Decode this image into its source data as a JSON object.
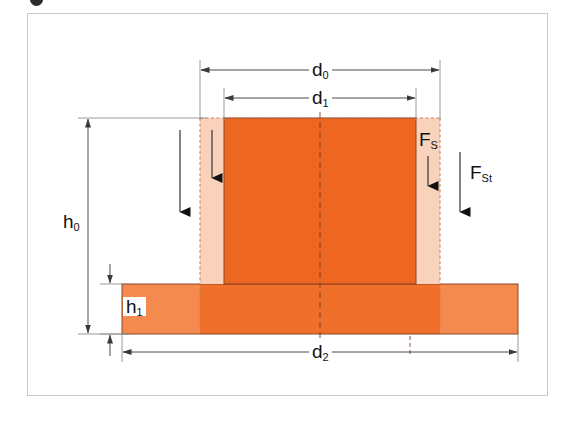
{
  "figure": {
    "type": "engineering-cross-section",
    "colors": {
      "core_orange": "#ee6722",
      "slab_inner_orange": "#ef6f2b",
      "slab_outer_orange": "#f58a4e",
      "sleeve_peach": "#f9d2bc",
      "outline": "#6f3a22",
      "frame_border": "#c9c9c9",
      "dimension_line": "#4a4a4a",
      "background": "#ffffff"
    },
    "dimensions": [
      {
        "id": "d0",
        "label": "d",
        "subscript": "0",
        "orientation": "horizontal",
        "position": "top"
      },
      {
        "id": "d1",
        "label": "d",
        "subscript": "1",
        "orientation": "horizontal",
        "position": "top"
      },
      {
        "id": "d2",
        "label": "d",
        "subscript": "2",
        "orientation": "horizontal",
        "position": "bottom"
      },
      {
        "id": "h0",
        "label": "h",
        "subscript": "0",
        "orientation": "vertical",
        "position": "left"
      },
      {
        "id": "h1",
        "label": "h",
        "subscript": "1",
        "orientation": "vertical",
        "position": "left"
      }
    ],
    "forces": [
      {
        "id": "Fs",
        "label": "F",
        "subscript": "S",
        "direction": "down"
      },
      {
        "id": "Fst",
        "label": "F",
        "subscript": "St",
        "direction": "down"
      }
    ]
  }
}
